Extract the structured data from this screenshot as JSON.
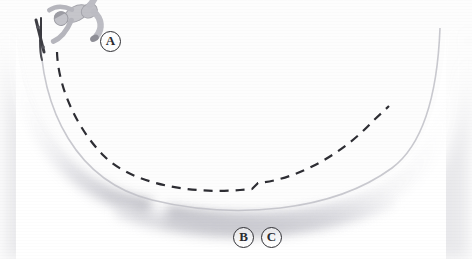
{
  "figure": {
    "background_color": "#fdfdfd"
  },
  "labels": [
    {
      "id": "A",
      "text": "A",
      "x": 110,
      "y": 41,
      "describes": "skateboarder at top of left wall"
    },
    {
      "id": "B",
      "text": "B",
      "x": 243,
      "y": 237,
      "describes": "point at bottom of bowl"
    },
    {
      "id": "C",
      "text": "C",
      "x": 271,
      "y": 237,
      "describes": "point just right of bottom of bowl"
    }
  ],
  "ramp": {
    "name": "skate-bowl",
    "fill_color": "#ffffff",
    "wall_shade_color": "#c9c9cf",
    "shadow_color": "#d6d6dc",
    "left_rim_x": 14,
    "right_rim_x": 458,
    "rim_y": 28,
    "bottom_y": 212
  },
  "trajectory": {
    "name": "dashed-path",
    "stroke_color": "#2d2d33",
    "dash_pattern": "9 7",
    "stroke_width": 2.2,
    "start": {
      "x": 57,
      "y": 52
    },
    "step_at": {
      "x": 255,
      "y": 186
    },
    "end": {
      "x": 389,
      "y": 106
    }
  },
  "skater": {
    "name": "skateboarder-figure",
    "body_color": "#c6c6cb",
    "outline_color": "#9a9aa1",
    "board_color": "#3a3a40",
    "orientation": "inverted-airborne-at-left-coping"
  },
  "colors": {
    "ink": "#2d2d33",
    "paper": "#fdfdfd",
    "shade_light": "#e8e8ed",
    "shade_mid": "#cfcfd6"
  }
}
